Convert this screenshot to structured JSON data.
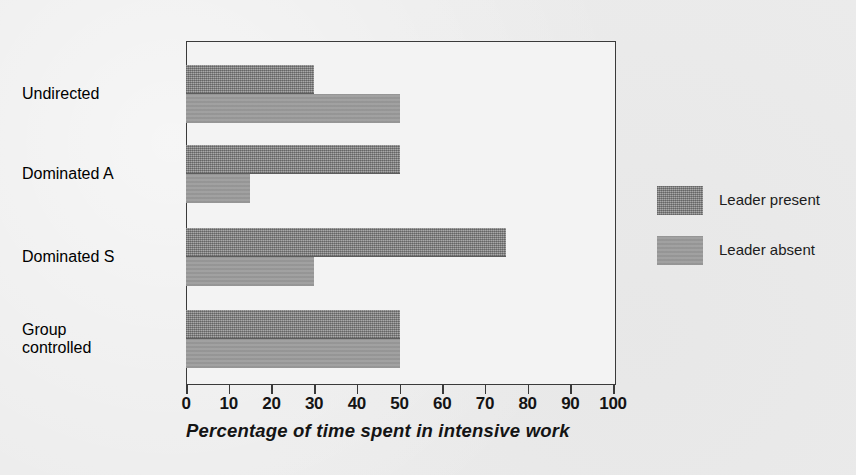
{
  "chart_data": {
    "type": "bar",
    "orientation": "horizontal",
    "title": "",
    "xlabel": "Percentage of time spent in intensive work",
    "ylabel": "",
    "xlim": [
      0,
      100
    ],
    "xticks": [
      0,
      10,
      20,
      30,
      40,
      50,
      60,
      70,
      80,
      90,
      100
    ],
    "xtick_labels": [
      "0",
      "10",
      "20",
      "30",
      "40",
      "50",
      "60",
      "70",
      "80",
      "90",
      "100"
    ],
    "grid": false,
    "legend_position": "right",
    "categories": [
      "Undirected",
      "Dominated A",
      "Dominated S",
      "Group controlled"
    ],
    "category_label_lines": [
      [
        "Undirected"
      ],
      [
        "Dominated A"
      ],
      [
        "Dominated S"
      ],
      [
        "Group",
        "controlled"
      ]
    ],
    "series": [
      {
        "name": "Leader present",
        "color": "#8c8c8c",
        "values": [
          30,
          50,
          75,
          50
        ]
      },
      {
        "name": "Leader absent",
        "color": "#9b9b9b",
        "values": [
          50,
          15,
          30,
          50
        ]
      }
    ]
  },
  "legend": {
    "items": [
      {
        "label": "Leader present",
        "swatch": "dark-gray-hatched"
      },
      {
        "label": "Leader absent",
        "swatch": "mid-gray-solid"
      }
    ]
  },
  "colors": {
    "page_background": "#ebebeb",
    "plot_background": "#f3f3f3",
    "axis": "#3a3a3a",
    "text": "#1c1c1c",
    "series_present": "#8c8c8c",
    "series_absent": "#9b9b9b"
  }
}
